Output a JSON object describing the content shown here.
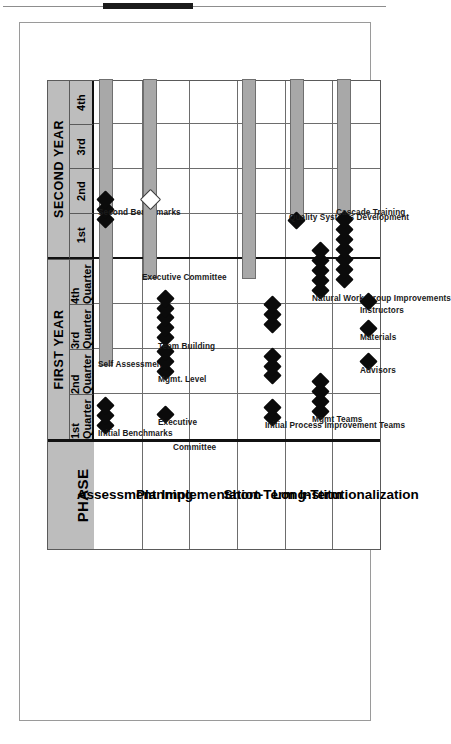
{
  "document": {
    "frame_border_color": "#9a9a9a",
    "header_rule_color": "#8d8d8d"
  },
  "chart_data": {
    "type": "gantt",
    "title": "",
    "phase_column_header": "PHASE",
    "header_fill": "#bdbdbd",
    "bar_fill": "#a8a8a8",
    "milestone_fill": "#0b0b0b",
    "grid": true,
    "legend": "",
    "years": [
      {
        "label": "FIRST YEAR",
        "quarters": [
          "1st Quarter",
          "2nd Quarter",
          "3rd Quarter",
          "4th Quarter"
        ]
      },
      {
        "label": "SECOND YEAR",
        "quarters": [
          "1st",
          "2nd",
          "3rd",
          "4th"
        ]
      }
    ],
    "x_axis": {
      "label": "",
      "tick_labels": [
        "1st Quarter",
        "2nd Quarter",
        "3rd Quarter",
        "4th Quarter",
        "1st",
        "2nd",
        "3rd",
        "4th"
      ],
      "range": [
        0,
        8
      ],
      "units": "quarters"
    },
    "y_axis": {
      "label": "PHASE"
    },
    "phases": [
      {
        "name": "Assessment"
      },
      {
        "name": "Planning"
      },
      {
        "name": "Implementation"
      },
      {
        "name": "Short-Term"
      },
      {
        "name": "Long-Term"
      },
      {
        "name": "Institutionalization"
      }
    ],
    "tasks": [
      {
        "phase": "Assessment",
        "label": "Initial Benchmarks",
        "type": "milestones",
        "milestones": [
          0.3,
          0.52,
          0.74
        ]
      },
      {
        "phase": "Assessment",
        "label": "Self Assessment",
        "type": "bar",
        "start": 1.62,
        "end": 4.88
      },
      {
        "phase": "Assessment",
        "label": "Second Benchmarks",
        "type": "bar-with-milestones",
        "start": 5.0,
        "end": 8.0,
        "milestones": [
          4.88,
          5.1,
          5.32
        ]
      },
      {
        "phase": "Planning",
        "label": "Executive",
        "type": "milestones",
        "milestones": [
          0.55
        ]
      },
      {
        "phase": "Planning",
        "label": "Committee",
        "type": "label-only",
        "milestones": []
      },
      {
        "phase": "Planning",
        "label": "Mgmt. Level",
        "type": "milestones",
        "milestones": [
          1.5,
          1.72,
          1.94
        ]
      },
      {
        "phase": "Planning",
        "label": "Team Building",
        "type": "milestones",
        "milestones": [
          2.25,
          2.47,
          2.69,
          2.91,
          3.13
        ]
      },
      {
        "phase": "Planning",
        "label": "Executive Committee",
        "type": "bar-with-milestones",
        "start": 3.55,
        "end": 8.0,
        "milestones": [
          5.3
        ],
        "milestone_style": "hollow"
      },
      {
        "phase": "Short-Term",
        "label": "Initial Process Improvement Teams",
        "type": "milestones",
        "milestones": [
          0.48,
          0.7,
          1.4,
          1.62,
          1.84,
          2.55,
          2.77,
          2.99
        ]
      },
      {
        "phase": "Short-Term",
        "label": "",
        "type": "bar",
        "start": 3.55,
        "end": 8.0
      },
      {
        "phase": "Long-Term",
        "label": "Mgmt Teams",
        "type": "milestones",
        "milestones": [
          0.62,
          0.84,
          1.06,
          1.28
        ]
      },
      {
        "phase": "Long-Term",
        "label": "Natural Work Group Improvements",
        "type": "milestones",
        "milestones": [
          3.3,
          3.52,
          3.74,
          3.96,
          4.18
        ]
      },
      {
        "phase": "Long-Term",
        "label": "Quality Systems Development",
        "type": "bar-with-milestones",
        "start": 4.88,
        "end": 8.0,
        "milestones": [
          4.86
        ]
      },
      {
        "phase": "Institutionalization",
        "label": "Advisors",
        "type": "milestones",
        "milestones": [
          1.72
        ]
      },
      {
        "phase": "Institutionalization",
        "label": "Materials",
        "type": "milestones",
        "milestones": [
          2.45
        ]
      },
      {
        "phase": "Institutionalization",
        "label": "Instructors",
        "type": "milestones",
        "milestones": [
          3.05
        ]
      },
      {
        "phase": "Institutionalization",
        "label": "Cascade Training",
        "type": "bar-with-milestones",
        "start": 5.0,
        "end": 8.0,
        "milestones": [
          3.55,
          3.77,
          3.99,
          4.21,
          4.43,
          4.65,
          4.87
        ]
      }
    ]
  }
}
